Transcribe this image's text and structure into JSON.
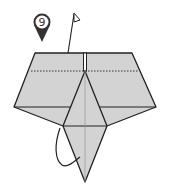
{
  "diagram": {
    "type": "origami-step",
    "step_number": "9",
    "colors": {
      "paper": "#d3d3d3",
      "line": "#222222",
      "badge_fill": "#ffffff",
      "badge_pin": "#333333",
      "background": "#ffffff"
    },
    "elements": [
      {
        "name": "step-badge",
        "label": "9"
      },
      {
        "name": "mountain-fold-arrow"
      },
      {
        "name": "valley-fold-line",
        "style": "dotted"
      },
      {
        "name": "center-slit"
      },
      {
        "name": "kite-flap"
      },
      {
        "name": "curved-arrow"
      }
    ]
  }
}
